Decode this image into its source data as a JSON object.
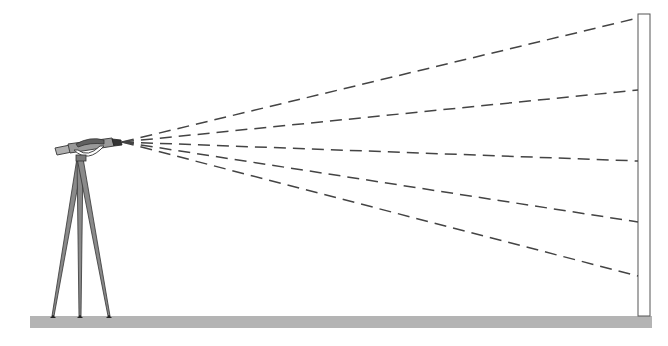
{
  "diagram": {
    "colors": {
      "background": "#ffffff",
      "ground": "#b4b4b4",
      "outline": "#555555",
      "beam": "#444444",
      "tripod_leg": "#8a8a8a",
      "device_body": "#9a9a9a",
      "device_dark": "#555555",
      "wall_fill": "#ffffff"
    },
    "ground": {
      "x": 30,
      "y": 316,
      "width": 622,
      "height": 12
    },
    "wall": {
      "x": 638,
      "y": 14,
      "width": 12,
      "height": 302
    },
    "beam_origin": {
      "x": 122,
      "y": 142
    },
    "beams": [
      {
        "end_x": 638,
        "end_y": 18
      },
      {
        "end_x": 638,
        "end_y": 90
      },
      {
        "end_x": 638,
        "end_y": 161
      },
      {
        "end_x": 638,
        "end_y": 222
      },
      {
        "end_x": 638,
        "end_y": 276
      }
    ],
    "tripod": {
      "head": {
        "x": 80,
        "y": 158
      },
      "feet": [
        {
          "x": 53,
          "y": 318
        },
        {
          "x": 80,
          "y": 318
        },
        {
          "x": 109,
          "y": 318
        }
      ]
    }
  }
}
